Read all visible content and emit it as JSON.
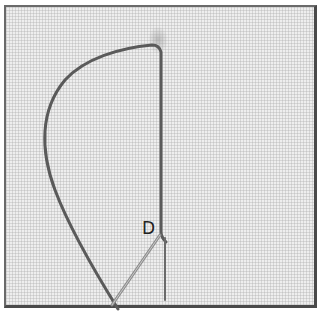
{
  "figure": {
    "point_label": "D",
    "colors": {
      "fabric": "#eeeeee",
      "thread": "#5a5a5a",
      "needle": "#8c8c8c",
      "frame": "#4a4a4a"
    }
  }
}
